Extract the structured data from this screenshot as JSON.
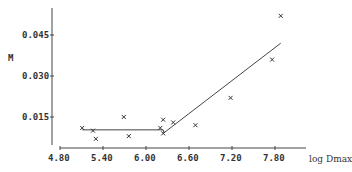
{
  "chart_data": {
    "type": "scatter",
    "title": "",
    "xlabel": "log Dmax",
    "ylabel": "M",
    "x_ticks": [
      "4.80",
      "5.40",
      "6.00",
      "6.60",
      "7.20",
      "7.80"
    ],
    "y_ticks": [
      "0.015",
      "0.030",
      "0.045"
    ],
    "xlim": [
      4.8,
      8.2
    ],
    "ylim": [
      0.0,
      0.055
    ],
    "grid": false,
    "marker": "x",
    "points": [
      {
        "x": 5.11,
        "y": 0.011
      },
      {
        "x": 5.26,
        "y": 0.01
      },
      {
        "x": 5.3,
        "y": 0.007
      },
      {
        "x": 5.69,
        "y": 0.015
      },
      {
        "x": 5.76,
        "y": 0.008
      },
      {
        "x": 6.2,
        "y": 0.011
      },
      {
        "x": 6.24,
        "y": 0.014
      },
      {
        "x": 6.24,
        "y": 0.009
      },
      {
        "x": 6.38,
        "y": 0.013
      },
      {
        "x": 6.69,
        "y": 0.012
      },
      {
        "x": 7.18,
        "y": 0.022
      },
      {
        "x": 7.76,
        "y": 0.036
      },
      {
        "x": 7.88,
        "y": 0.052
      }
    ],
    "fit_line": [
      {
        "x": 5.11,
        "y": 0.0103
      },
      {
        "x": 6.24,
        "y": 0.0103
      },
      {
        "x": 6.25,
        "y": 0.0092
      },
      {
        "x": 7.88,
        "y": 0.042
      }
    ]
  }
}
